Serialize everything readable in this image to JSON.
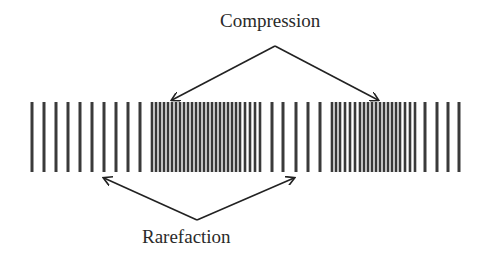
{
  "labels": {
    "top": "Compression",
    "bottom": "Rarefaction"
  },
  "colors": {
    "bar": "#3a3a3a",
    "arrow": "#222222",
    "text": "#2a2a2a"
  },
  "bars": {
    "top": 102,
    "bottom": 172,
    "sparse_left": [
      32,
      44,
      56,
      68,
      80,
      92,
      104,
      116,
      128,
      140
    ],
    "dense_1": [
      152,
      156,
      160,
      164,
      168,
      172,
      176,
      180,
      184,
      188,
      192,
      196,
      200,
      204,
      208,
      212,
      216,
      220,
      224,
      228,
      232,
      236,
      240,
      245,
      250,
      255,
      260
    ],
    "sparse_mid": [
      272,
      283,
      296,
      308,
      320
    ],
    "dense_2": [
      332,
      336,
      340,
      345,
      350,
      355,
      360,
      364,
      368,
      372,
      376,
      380,
      384,
      388,
      392,
      396,
      400,
      405,
      410,
      415
    ],
    "sparse_right": [
      425,
      437,
      448,
      459
    ]
  }
}
